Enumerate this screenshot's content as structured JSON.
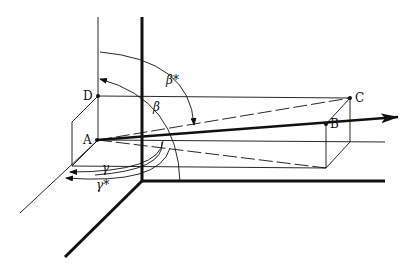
{
  "diagram": {
    "points": {
      "A": "A",
      "B": "B",
      "C": "C",
      "D": "D"
    },
    "angles": {
      "beta": "β",
      "beta_star": "β*",
      "gamma": "γ",
      "gamma_star": "γ*"
    },
    "colors": {
      "ink": "#111111",
      "background": "#ffffff"
    }
  }
}
